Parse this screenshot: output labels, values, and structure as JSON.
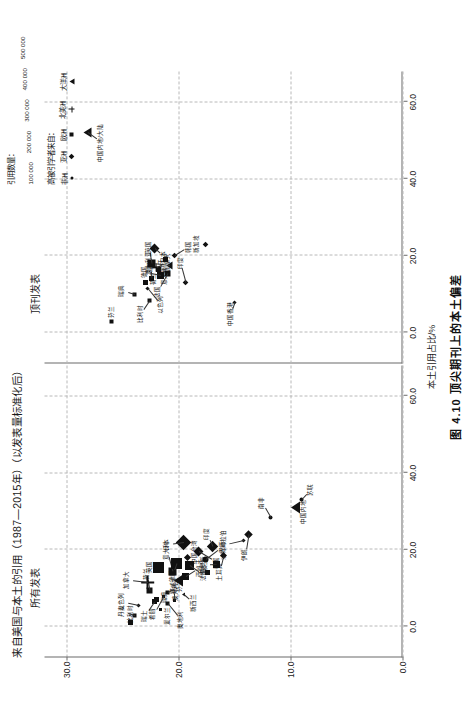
{
  "figure": {
    "main_title": "来自美国与本土的引用（1987—2015年）（以发表量标准化后）",
    "caption": "图 4.10  顶尖期刊上的本土偏差",
    "xlabel": "本土引用占比/%",
    "ylabel": "美国引用占比/%",
    "panel_left_title": "所有发表",
    "panel_right_title": "顶刊发表"
  },
  "legend": {
    "size_title": "引用数量：",
    "sizes": [
      {
        "label": "100 000",
        "d": 3
      },
      {
        "label": "200 000",
        "d": 5
      },
      {
        "label": "300 000",
        "d": 7
      },
      {
        "label": "400 000",
        "d": 9
      },
      {
        "label": "500 000",
        "d": 11
      }
    ],
    "shape_title": "高被引学者来自：",
    "shapes": [
      {
        "name": "非洲",
        "glyph": "c"
      },
      {
        "name": "亚洲",
        "glyph": "di"
      },
      {
        "name": "欧洲",
        "glyph": "sq"
      },
      {
        "name": "北美洲",
        "glyph": "pl"
      },
      {
        "name": "大洋洲",
        "glyph": "tr"
      }
    ]
  },
  "chart_data": {
    "type": "scatter",
    "title": "来自美国与本土的引用（1987—2015年）（以发表量标准化后）",
    "xlabel": "本土引用占比/%",
    "ylabel": "美国引用占比/%",
    "xlim": [
      -8,
      68
    ],
    "ylim": [
      0,
      32
    ],
    "xticks": [
      0.0,
      20.0,
      40.0,
      60.0
    ],
    "yticks": [
      0.0,
      10.0,
      20.0,
      30.0
    ],
    "xtick_labels": [
      "0.0",
      "20.0",
      "40.0",
      "60.0"
    ],
    "ytick_labels": [
      "0.0",
      "10.0",
      "20.0",
      "30.0"
    ],
    "grid": true,
    "legend_position": "top-right",
    "panels": [
      {
        "name": "所有发表",
        "points": [
          {
            "label": "比利时",
            "x": 1.0,
            "y": 24.3,
            "shape": "square",
            "size": 5
          },
          {
            "label": "丹麦",
            "x": 3.0,
            "y": 24.0,
            "shape": "square",
            "size": 4
          },
          {
            "label": "瑞士",
            "x": 6.5,
            "y": 22.2,
            "shape": "square",
            "size": 5
          },
          {
            "label": "奥地利",
            "x": 6.0,
            "y": 21.0,
            "shape": "square",
            "size": 4
          },
          {
            "label": "瑞典",
            "x": 7.0,
            "y": 22.0,
            "shape": "square",
            "size": 5
          },
          {
            "label": "挪威",
            "x": 6.8,
            "y": 20.4,
            "shape": "square",
            "size": 3
          },
          {
            "label": "以色列",
            "x": 5.5,
            "y": 23.6,
            "shape": "diamond",
            "size": 3
          },
          {
            "label": "希腊",
            "x": 8.0,
            "y": 21.4,
            "shape": "square",
            "size": 3
          },
          {
            "label": "爱尔兰",
            "x": 4.5,
            "y": 21.6,
            "shape": "square",
            "size": 3
          },
          {
            "label": "芬兰",
            "x": 9.0,
            "y": 21.0,
            "shape": "square",
            "size": 4
          },
          {
            "label": "荷兰",
            "x": 9.5,
            "y": 22.6,
            "shape": "square",
            "size": 6
          },
          {
            "label": "加拿大",
            "x": 11.5,
            "y": 22.8,
            "shape": "plus",
            "size": 9
          },
          {
            "label": "澳大利亚",
            "x": 12.0,
            "y": 20.0,
            "shape": "tri",
            "size": 8
          },
          {
            "label": "新西兰",
            "x": 8.5,
            "y": 19.6,
            "shape": "tri",
            "size": 3
          },
          {
            "label": "西班牙",
            "x": 13.0,
            "y": 19.4,
            "shape": "square",
            "size": 7
          },
          {
            "label": "意大利",
            "x": 14.5,
            "y": 20.6,
            "shape": "square",
            "size": 8
          },
          {
            "label": "英国",
            "x": 15.5,
            "y": 21.8,
            "shape": "square",
            "size": 11
          },
          {
            "label": "德国",
            "x": 16.5,
            "y": 20.2,
            "shape": "square",
            "size": 11
          },
          {
            "label": "法国",
            "x": 16.0,
            "y": 19.0,
            "shape": "square",
            "size": 9
          },
          {
            "label": "巴西",
            "x": 17.5,
            "y": 17.6,
            "shape": "circle",
            "size": 6
          },
          {
            "label": "波兰",
            "x": 14.0,
            "y": 17.4,
            "shape": "square",
            "size": 5
          },
          {
            "label": "俄罗斯",
            "x": 16.2,
            "y": 16.6,
            "shape": "square",
            "size": 7
          },
          {
            "label": "土耳其",
            "x": 18.5,
            "y": 16.0,
            "shape": "diamond",
            "size": 5
          },
          {
            "label": "韩国",
            "x": 19.5,
            "y": 18.2,
            "shape": "diamond",
            "size": 7
          },
          {
            "label": "中国台湾",
            "x": 18.0,
            "y": 19.2,
            "shape": "diamond",
            "size": 5
          },
          {
            "label": "印度",
            "x": 21.0,
            "y": 17.0,
            "shape": "diamond",
            "size": 8
          },
          {
            "label": "日本",
            "x": 22.0,
            "y": 19.6,
            "shape": "diamond",
            "size": 11
          },
          {
            "label": "伊朗",
            "x": 24.0,
            "y": 13.8,
            "shape": "diamond",
            "size": 6
          },
          {
            "label": "中国内地",
            "x": 31.0,
            "y": 9.6,
            "shape": "tri",
            "size": 8
          },
          {
            "label": "苏联",
            "x": 33.0,
            "y": 9.0,
            "shape": "circle",
            "size": 4
          },
          {
            "label": "南非",
            "x": 28.5,
            "y": 11.8,
            "shape": "circle",
            "size": 4
          },
          {
            "label": "沙特阿拉伯",
            "x": 22.5,
            "y": 14.2,
            "shape": "diamond",
            "size": 3
          }
        ]
      },
      {
        "name": "顶刊发表",
        "points": [
          {
            "label": "芬兰",
            "x": 3.0,
            "y": 26.0,
            "shape": "square",
            "size": 4
          },
          {
            "label": "瑞典",
            "x": 10.0,
            "y": 24.0,
            "shape": "square",
            "size": 4
          },
          {
            "label": "比利时",
            "x": 8.5,
            "y": 22.6,
            "shape": "square",
            "size": 4
          },
          {
            "label": "以色列",
            "x": 11.5,
            "y": 22.8,
            "shape": "diamond",
            "size": 3
          },
          {
            "label": "荷兰",
            "x": 13.0,
            "y": 23.0,
            "shape": "square",
            "size": 5
          },
          {
            "label": "瑞士",
            "x": 14.0,
            "y": 22.4,
            "shape": "square",
            "size": 5
          },
          {
            "label": "德国",
            "x": 15.0,
            "y": 21.6,
            "shape": "square",
            "size": 7
          },
          {
            "label": "法国",
            "x": 15.5,
            "y": 21.0,
            "shape": "square",
            "size": 6
          },
          {
            "label": "意大利",
            "x": 16.5,
            "y": 21.8,
            "shape": "square",
            "size": 5
          },
          {
            "label": "加拿大",
            "x": 17.0,
            "y": 22.0,
            "shape": "plus",
            "size": 6
          },
          {
            "label": "英国",
            "x": 18.0,
            "y": 22.4,
            "shape": "square",
            "size": 8
          },
          {
            "label": "澳大利亚",
            "x": 17.5,
            "y": 20.8,
            "shape": "tri",
            "size": 5
          },
          {
            "label": "西班牙",
            "x": 19.0,
            "y": 21.2,
            "shape": "square",
            "size": 5
          },
          {
            "label": "日本",
            "x": 22.0,
            "y": 22.2,
            "shape": "diamond",
            "size": 7
          },
          {
            "label": "韩国",
            "x": 20.0,
            "y": 20.4,
            "shape": "diamond",
            "size": 4
          },
          {
            "label": "印度",
            "x": 13.0,
            "y": 19.4,
            "shape": "diamond",
            "size": 4
          },
          {
            "label": "新加坡",
            "x": 23.0,
            "y": 17.6,
            "shape": "diamond",
            "size": 4
          },
          {
            "label": "中国香港",
            "x": 8.0,
            "y": 15.0,
            "shape": "diamond",
            "size": 3
          },
          {
            "label": "中国内地/大陆",
            "x": 52.0,
            "y": 28.2,
            "shape": "tri",
            "size": 7
          }
        ]
      }
    ]
  }
}
